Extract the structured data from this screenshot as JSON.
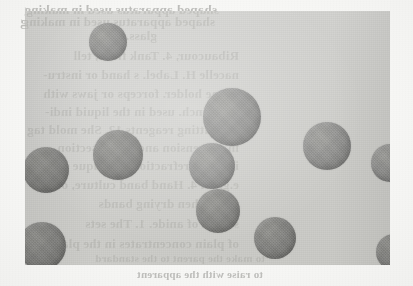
{
  "page": {
    "type": "scanned-book-page",
    "width": 413,
    "height": 286,
    "paper_color": "#f7f7f5"
  },
  "photo": {
    "caption": "",
    "background_color": "#d2d2cf",
    "particle_color": "#8a8a87",
    "left": 25,
    "top": 11,
    "width": 365,
    "height": 254,
    "particles": [
      {
        "id": "particle-1",
        "cx": 108,
        "cy": 42,
        "r": 19,
        "shade": "light"
      },
      {
        "id": "particle-2",
        "cx": 232,
        "cy": 117,
        "r": 29,
        "shade": "light"
      },
      {
        "id": "particle-3",
        "cx": 118,
        "cy": 155,
        "r": 25,
        "shade": "dark"
      },
      {
        "id": "particle-4",
        "cx": 46,
        "cy": 170,
        "r": 23,
        "shade": "dark"
      },
      {
        "id": "particle-5",
        "cx": 212,
        "cy": 166,
        "r": 23,
        "shade": "light"
      },
      {
        "id": "particle-6",
        "cx": 327,
        "cy": 146,
        "r": 24,
        "shade": "light"
      },
      {
        "id": "particle-7",
        "cx": 390,
        "cy": 163,
        "r": 19,
        "shade": "light"
      },
      {
        "id": "particle-8",
        "cx": 218,
        "cy": 211,
        "r": 22,
        "shade": "dark"
      },
      {
        "id": "particle-9",
        "cx": 275,
        "cy": 238,
        "r": 21,
        "shade": "dark"
      },
      {
        "id": "particle-10",
        "cx": 42,
        "cy": 246,
        "r": 24,
        "shade": "dark"
      },
      {
        "id": "particle-11",
        "cx": 394,
        "cy": 252,
        "r": 18,
        "shade": "dark"
      }
    ]
  },
  "bleed_through_text": {
    "note": "Text is mirror-reversed (show-through from the verso of the leaf).",
    "color": "#b9b9b6",
    "lines": [
      {
        "id": "line-1",
        "text": "shaped apparatus used in making",
        "x": 196,
        "y": 2,
        "size": 13
      },
      {
        "id": "line-2",
        "text": "shaped apparatus used in making",
        "x": 200,
        "y": 14,
        "size": 13
      },
      {
        "id": "line-3",
        "text": "glass.",
        "x": 258,
        "y": 28,
        "size": 13
      },
      {
        "id": "line-4",
        "text": "Ribaucour, 4. Tank flask, tell",
        "x": 176,
        "y": 48,
        "size": 13
      },
      {
        "id": "line-5",
        "text": "nacelle H. Label. s hand or instru-",
        "x": 176,
        "y": 67,
        "size": 13
      },
      {
        "id": "line-6",
        "text": "brane holder. forceps or jaws with",
        "x": 176,
        "y": 86,
        "size": 13
      },
      {
        "id": "line-7",
        "text": "pivot inch. used in the liquid indi-",
        "x": 176,
        "y": 104,
        "size": 13
      },
      {
        "id": "line-8",
        "text": "the cutting reagents 12. She mold tag",
        "x": 176,
        "y": 122,
        "size": 13
      },
      {
        "id": "line-9",
        "text": "in suspension and extra. section",
        "x": 176,
        "y": 140,
        "size": 13
      },
      {
        "id": "line-10",
        "text": "is called refraction technique and",
        "x": 176,
        "y": 158,
        "size": 13
      },
      {
        "id": "line-11",
        "text": "e.g. as. 4. Hand band culture, on an",
        "x": 176,
        "y": 177,
        "size": 13
      },
      {
        "id": "line-12",
        "text": "finer when drying bands",
        "x": 176,
        "y": 196,
        "size": 13
      },
      {
        "id": "line-13",
        "text": "strand of anide. 1. The sets",
        "x": 176,
        "y": 216,
        "size": 13
      },
      {
        "id": "line-14",
        "text": "of plain concentrates in the plates",
        "x": 176,
        "y": 236,
        "size": 13
      },
      {
        "id": "line-15",
        "text": "to make the parent to the standard",
        "x": 150,
        "y": 252,
        "size": 11
      },
      {
        "id": "line-16",
        "text": "to raise with the apparent",
        "x": 150,
        "y": 268,
        "size": 11
      }
    ]
  }
}
